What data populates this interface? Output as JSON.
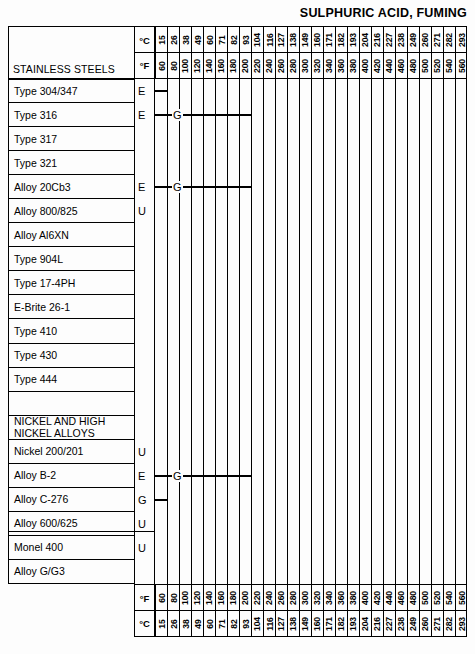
{
  "title": "SULPHURIC ACID, FUMING",
  "axis": {
    "unit_c_label": "°C",
    "unit_f_label": "°F",
    "celsius": [
      15,
      26,
      38,
      49,
      60,
      71,
      82,
      93,
      104,
      116,
      127,
      138,
      149,
      160,
      171,
      182,
      193,
      204,
      216,
      227,
      238,
      249,
      260,
      271,
      282,
      293
    ],
    "fahrenheit": [
      60,
      80,
      100,
      120,
      140,
      160,
      180,
      200,
      220,
      240,
      260,
      280,
      300,
      320,
      340,
      360,
      380,
      400,
      420,
      440,
      460,
      480,
      500,
      520,
      540,
      560
    ]
  },
  "section_header_label": "STAINLESS STEELS",
  "chart_data": {
    "type": "table",
    "title": "SULPHURIC ACID, FUMING",
    "xlabel": "Temperature",
    "ylabel": "Alloy",
    "x_units": [
      "°F",
      "°C"
    ],
    "x_fahrenheit": [
      60,
      80,
      100,
      120,
      140,
      160,
      180,
      200,
      220,
      240,
      260,
      280,
      300,
      320,
      340,
      360,
      380,
      400,
      420,
      440,
      460,
      480,
      500,
      520,
      540,
      560
    ],
    "x_celsius": [
      15,
      26,
      38,
      49,
      60,
      71,
      82,
      93,
      104,
      116,
      127,
      138,
      149,
      160,
      171,
      182,
      193,
      204,
      216,
      227,
      238,
      249,
      260,
      271,
      282,
      293
    ],
    "rating_codes": [
      "E",
      "G",
      "U"
    ],
    "groups": [
      "STAINLESS STEELS",
      "NICKEL AND HIGH NICKEL ALLOYS"
    ],
    "rows": [
      {
        "label": "Type 304/347",
        "code": "E",
        "bar_start_f": 60,
        "bar_end_f": 80,
        "segments": [
          {
            "code": "E",
            "from_f": 60,
            "to_f": 80
          }
        ]
      },
      {
        "label": "Type 316",
        "code": "E",
        "bar_start_f": 60,
        "bar_end_f": 220,
        "segments": [
          {
            "code": "E",
            "from_f": 60,
            "to_f": 100
          },
          {
            "code": "G",
            "from_f": 100,
            "to_f": 220
          }
        ]
      },
      {
        "label": "Type 317",
        "code": "",
        "bar_start_f": null,
        "bar_end_f": null,
        "segments": []
      },
      {
        "label": "Type 321",
        "code": "",
        "bar_start_f": null,
        "bar_end_f": null,
        "segments": []
      },
      {
        "label": "Alloy 20Cb3",
        "code": "E",
        "bar_start_f": 60,
        "bar_end_f": 220,
        "segments": [
          {
            "code": "E",
            "from_f": 60,
            "to_f": 100
          },
          {
            "code": "G",
            "from_f": 100,
            "to_f": 220
          }
        ]
      },
      {
        "label": "Alloy 800/825",
        "code": "U",
        "bar_start_f": null,
        "bar_end_f": null,
        "segments": []
      },
      {
        "label": "Alloy Al6XN",
        "code": "",
        "bar_start_f": null,
        "bar_end_f": null,
        "segments": []
      },
      {
        "label": "Type 904L",
        "code": "",
        "bar_start_f": null,
        "bar_end_f": null,
        "segments": []
      },
      {
        "label": "Type 17-4PH",
        "code": "",
        "bar_start_f": null,
        "bar_end_f": null,
        "segments": []
      },
      {
        "label": "E-Brite 26-1",
        "code": "",
        "bar_start_f": null,
        "bar_end_f": null,
        "segments": []
      },
      {
        "label": "Type 410",
        "code": "",
        "bar_start_f": null,
        "bar_end_f": null,
        "segments": []
      },
      {
        "label": "Type 430",
        "code": "",
        "bar_start_f": null,
        "bar_end_f": null,
        "segments": []
      },
      {
        "label": "Type 444",
        "code": "",
        "bar_start_f": null,
        "bar_end_f": null,
        "segments": []
      },
      {
        "label": "",
        "code": "",
        "bar_start_f": null,
        "bar_end_f": null,
        "segments": []
      },
      {
        "label": "NICKEL AND HIGH NICKEL ALLOYS",
        "code": "",
        "group_header": true,
        "bar_start_f": null,
        "bar_end_f": null,
        "segments": []
      },
      {
        "label": "Nickel 200/201",
        "code": "U",
        "bar_start_f": null,
        "bar_end_f": null,
        "segments": []
      },
      {
        "label": "Alloy B-2",
        "code": "E",
        "bar_start_f": 60,
        "bar_end_f": 220,
        "segments": [
          {
            "code": "E",
            "from_f": 60,
            "to_f": 100
          },
          {
            "code": "G",
            "from_f": 100,
            "to_f": 220
          }
        ]
      },
      {
        "label": "Alloy C-276",
        "code": "G",
        "bar_start_f": 60,
        "bar_end_f": 80,
        "segments": [
          {
            "code": "G",
            "from_f": 60,
            "to_f": 80
          }
        ]
      },
      {
        "label": "Alloy 600/625",
        "code": "U",
        "bar_start_f": null,
        "bar_end_f": null,
        "segments": []
      },
      {
        "label": "Monel 400",
        "code": "U",
        "bar_start_f": null,
        "bar_end_f": null,
        "segments": []
      },
      {
        "label": "Alloy G/G3",
        "code": "",
        "bar_start_f": null,
        "bar_end_f": null,
        "segments": []
      }
    ]
  },
  "rows": [
    {
      "label": "Type 304/347",
      "line2": "",
      "code": "E",
      "bar": {
        "start": 0,
        "end": 1
      },
      "gcode": null
    },
    {
      "label": "Type 316",
      "line2": "",
      "code": "E",
      "bar": {
        "start": 0,
        "end": 8
      },
      "gcode": {
        "at": 2,
        "text": "G"
      }
    },
    {
      "label": "Type 317",
      "line2": "",
      "code": "",
      "bar": null,
      "gcode": null
    },
    {
      "label": "Type 321",
      "line2": "",
      "code": "",
      "bar": null,
      "gcode": null
    },
    {
      "label": "Alloy 20Cb3",
      "line2": "",
      "code": "E",
      "bar": {
        "start": 0,
        "end": 8
      },
      "gcode": {
        "at": 2,
        "text": "G"
      }
    },
    {
      "label": "Alloy 800/825",
      "line2": "",
      "code": "U",
      "bar": null,
      "gcode": null
    },
    {
      "label": "Alloy Al6XN",
      "line2": "",
      "code": "",
      "bar": null,
      "gcode": null
    },
    {
      "label": "Type 904L",
      "line2": "",
      "code": "",
      "bar": null,
      "gcode": null
    },
    {
      "label": "Type 17-4PH",
      "line2": "",
      "code": "",
      "bar": null,
      "gcode": null
    },
    {
      "label": "E-Brite 26-1",
      "line2": "",
      "code": "",
      "bar": null,
      "gcode": null
    },
    {
      "label": "Type 410",
      "line2": "",
      "code": "",
      "bar": null,
      "gcode": null
    },
    {
      "label": "Type 430",
      "line2": "",
      "code": "",
      "bar": null,
      "gcode": null
    },
    {
      "label": "Type 444",
      "line2": "",
      "code": "",
      "bar": null,
      "gcode": null
    },
    {
      "label": "",
      "line2": "",
      "code": "",
      "bar": null,
      "gcode": null
    },
    {
      "label": "NICKEL AND HIGH",
      "line2": "NICKEL ALLOYS",
      "code": "",
      "bar": null,
      "gcode": null
    },
    {
      "label": "Nickel 200/201",
      "line2": "",
      "code": "U",
      "bar": null,
      "gcode": null
    },
    {
      "label": "Alloy B-2",
      "line2": "",
      "code": "E",
      "bar": {
        "start": 0,
        "end": 8
      },
      "gcode": {
        "at": 2,
        "text": "G"
      }
    },
    {
      "label": "Alloy C-276",
      "line2": "",
      "code": "G",
      "bar": {
        "start": 0,
        "end": 1
      },
      "gcode": null
    },
    {
      "label": "Alloy 600/625",
      "line2": "",
      "code": "U",
      "bar": null,
      "gcode": null
    },
    {
      "label": "Monel 400",
      "line2": "",
      "code": "U",
      "bar": null,
      "gcode": null
    },
    {
      "label": "Alloy G/G3",
      "line2": "",
      "code": "",
      "bar": null,
      "gcode": null
    }
  ]
}
